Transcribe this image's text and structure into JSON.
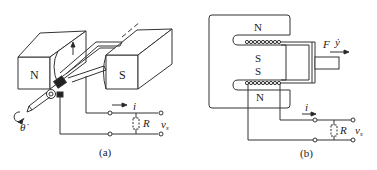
{
  "figure_a": {
    "caption": "(a)",
    "magnet_left_label": "N",
    "magnet_right_label": "S",
    "current_label": "i",
    "resistor_label": "R",
    "voltage_label": "v",
    "voltage_subscript": "s",
    "angle_label": "θ̇",
    "arrow_direction_icon": "arrow-up-icon"
  },
  "figure_b": {
    "caption": "(b)",
    "pole_top_label": "N",
    "pole_mid_upper_label": "S",
    "pole_mid_lower_label": "S",
    "pole_bottom_label": "N",
    "force_label": "F",
    "velocity_label": "ẏ",
    "current_label": "i",
    "resistor_label": "R",
    "voltage_label": "v",
    "voltage_subscript": "s"
  },
  "colors": {
    "line": "#333333",
    "fill_dark": "#222222",
    "background": "#ffffff"
  }
}
